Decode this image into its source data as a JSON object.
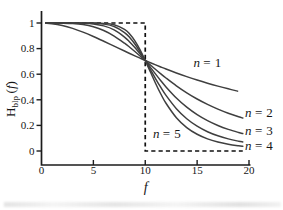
{
  "chart_data": {
    "type": "line",
    "title": "",
    "xlabel": "f",
    "ylabel": {
      "base": "H",
      "sub": "blp",
      "suffix": "(f)"
    },
    "xlim": [
      0,
      20
    ],
    "ylim": [
      0,
      1
    ],
    "grid": false,
    "legend_position": "inline-annotations",
    "cutoff_frequency": 10,
    "x_ticks": [
      0,
      5,
      10,
      15,
      20
    ],
    "x_tick_labels": [
      "0",
      "5",
      "10",
      "15",
      "20"
    ],
    "y_ticks": [
      0,
      0.2,
      0.4,
      0.6,
      0.8,
      1
    ],
    "y_tick_labels": [
      "0",
      "0.2",
      "0.4",
      "0.6",
      "0.8",
      "1"
    ],
    "x": [
      0,
      1,
      2,
      3,
      4,
      5,
      6,
      7,
      8,
      8.5,
      9,
      9.5,
      10,
      10.5,
      11,
      11.5,
      12,
      13,
      14,
      15,
      16,
      17,
      18,
      19,
      20
    ],
    "series": [
      {
        "name": "n = 1",
        "order": 1,
        "f_end": 18.9,
        "values": [
          1.0,
          0.995,
          0.9806,
          0.9578,
          0.9285,
          0.8944,
          0.8575,
          0.8192,
          0.7809,
          0.762,
          0.7433,
          0.7251,
          0.7071,
          0.6897,
          0.6727,
          0.6562,
          0.6402,
          0.6097,
          0.5812,
          0.5547,
          0.53,
          0.507,
          0.4856,
          0.4657,
          0.4472
        ]
      },
      {
        "name": "n = 2",
        "order": 2,
        "f_end": 19.4,
        "values": [
          1.0,
          1.0,
          0.9992,
          0.996,
          0.9875,
          0.9701,
          0.9409,
          0.898,
          0.8423,
          0.8106,
          0.7771,
          0.7424,
          0.7071,
          0.6718,
          0.6371,
          0.6031,
          0.5704,
          0.5092,
          0.4545,
          0.4061,
          0.3639,
          0.327,
          0.2949,
          0.267,
          0.2425
        ]
      },
      {
        "name": "n = 3",
        "order": 3,
        "f_end": 19.4,
        "values": [
          1.0,
          1.0,
          1.0,
          0.9996,
          0.998,
          0.9923,
          0.9774,
          0.946,
          0.8903,
          0.8521,
          0.8082,
          0.7592,
          0.7071,
          0.6537,
          0.6007,
          0.5494,
          0.5009,
          0.4143,
          0.3424,
          0.2841,
          0.2372,
          0.1995,
          0.169,
          0.1443,
          0.124
        ]
      },
      {
        "name": "n = 4",
        "order": 4,
        "f_end": 19.4,
        "values": [
          1.0,
          1.0,
          1.0,
          1.0,
          0.9997,
          0.9981,
          0.9917,
          0.9724,
          0.9254,
          0.8865,
          0.8359,
          0.7754,
          0.7071,
          0.6353,
          0.564,
          0.4963,
          0.4344,
          0.3305,
          0.2519,
          0.1938,
          0.1508,
          0.1189,
          0.0948,
          0.0765,
          0.0624
        ]
      },
      {
        "name": "n = 5",
        "order": 5,
        "f_end": 19.4,
        "values": [
          1.0,
          1.0,
          1.0,
          1.0,
          1.0,
          0.9995,
          0.997,
          0.9862,
          0.9502,
          0.9141,
          0.8606,
          0.7909,
          0.7071,
          0.6168,
          0.5275,
          0.4452,
          0.3729,
          0.2601,
          0.1828,
          0.1306,
          0.0949,
          0.0703,
          0.0528,
          0.0404,
          0.0312
        ]
      }
    ],
    "ideal_filter": {
      "style": "dashed",
      "points": [
        [
          0.4,
          1
        ],
        [
          10,
          1
        ],
        [
          10,
          0
        ],
        [
          19.4,
          0
        ]
      ]
    },
    "annotations": [
      {
        "text": "n = 1",
        "x": 16.0,
        "y": 0.69,
        "anchor": "middle"
      },
      {
        "text": "n = 2",
        "x": 19.62,
        "y": 0.3,
        "anchor": "start"
      },
      {
        "text": "n = 3",
        "x": 19.62,
        "y": 0.157,
        "anchor": "start"
      },
      {
        "text": "n = 4",
        "x": 19.62,
        "y": 0.04,
        "anchor": "start"
      },
      {
        "text": "n = 5",
        "x": 12.1,
        "y": 0.135,
        "anchor": "middle"
      }
    ],
    "colors": {
      "curve": "#3f3f3f",
      "axis": "#1c1c1c",
      "ideal": "#101010",
      "text": "#161616",
      "background": "#ffffff"
    }
  }
}
